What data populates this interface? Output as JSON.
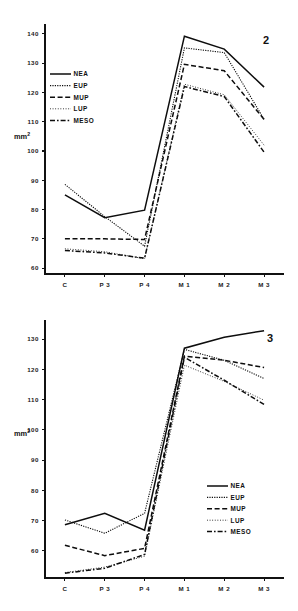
{
  "figure": {
    "background_color": "#ffffff",
    "ink_color": "#0d0d0d",
    "y_axis_label_main": "mm",
    "y_axis_label_exponent": "2"
  },
  "series_styles": [
    {
      "key": "NEA",
      "label": "NEA",
      "dash": "none",
      "width": 1.5
    },
    {
      "key": "EUP",
      "label": "EUP",
      "dash": "1.2,1.2",
      "width": 1.1
    },
    {
      "key": "MUP",
      "label": "MUP",
      "dash": "5,2.6",
      "width": 1.5
    },
    {
      "key": "LUP",
      "label": "LUP",
      "dash": "0.9,1.7",
      "width": 0.9
    },
    {
      "key": "MESO",
      "label": "MESO",
      "dash": "5,2,1.6,2",
      "width": 1.5
    }
  ],
  "chart_data": [
    {
      "id": "chart-2",
      "type": "line",
      "title": "2",
      "panel_number": "2",
      "xlabel": "",
      "ylabel": "mm2",
      "categories": [
        "C",
        "P 3",
        "P 4",
        "M 1",
        "M 2",
        "M 3"
      ],
      "ylim": [
        58,
        142
      ],
      "yticks": [
        60,
        70,
        80,
        90,
        100,
        110,
        120,
        130,
        140
      ],
      "ytick_labels": [
        "60",
        "70",
        "80",
        "90",
        "100",
        "110",
        "120",
        "130",
        "140"
      ],
      "grid": false,
      "legend_position": "upper-left-inside",
      "series": [
        {
          "name": "NEA",
          "values": [
            85.0,
            77.2,
            79.8,
            139.2,
            134.8,
            121.8
          ]
        },
        {
          "name": "EUP",
          "values": [
            88.6,
            77.6,
            67.5,
            135.2,
            133.6,
            110.8
          ]
        },
        {
          "name": "MUP",
          "values": [
            70.0,
            70.0,
            69.8,
            129.6,
            127.4,
            110.8
          ]
        },
        {
          "name": "LUP",
          "values": [
            66.6,
            65.6,
            63.2,
            122.8,
            119.2,
            102.0
          ]
        },
        {
          "name": "MESO",
          "values": [
            66.0,
            65.2,
            63.4,
            122.0,
            118.6,
            99.6
          ]
        }
      ]
    },
    {
      "id": "chart-3",
      "type": "line",
      "title": "3",
      "panel_number": "3",
      "xlabel": "",
      "ylabel": "mm2",
      "categories": [
        "C",
        "P 3",
        "P 4",
        "M 1",
        "M 2",
        "M 3"
      ],
      "ylim": [
        51,
        135
      ],
      "yticks": [
        60,
        70,
        80,
        90,
        100,
        110,
        120,
        130
      ],
      "ytick_labels": [
        "60",
        "70",
        "80",
        "90",
        "100",
        "110",
        "120",
        "130"
      ],
      "grid": false,
      "legend_position": "lower-right-inside",
      "series": [
        {
          "name": "NEA",
          "values": [
            68.6,
            72.4,
            66.8,
            127.0,
            130.6,
            132.8
          ]
        },
        {
          "name": "EUP",
          "values": [
            70.2,
            65.8,
            72.4,
            126.6,
            123.0,
            117.0
          ]
        },
        {
          "name": "MUP",
          "values": [
            61.8,
            58.4,
            60.8,
            124.4,
            123.0,
            120.6
          ]
        },
        {
          "name": "LUP",
          "values": [
            52.8,
            54.6,
            58.2,
            121.4,
            116.0,
            109.8
          ]
        },
        {
          "name": "MESO",
          "values": [
            52.6,
            54.2,
            58.8,
            124.0,
            116.4,
            108.4
          ]
        }
      ]
    }
  ]
}
